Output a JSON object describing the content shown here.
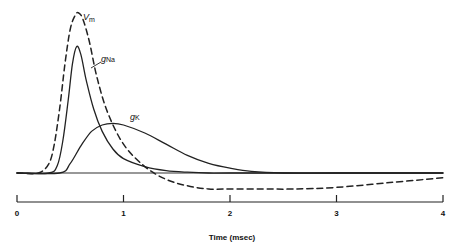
{
  "chart_data": {
    "type": "line",
    "title": "",
    "xlabel": "Time (msec)",
    "ylabel": "",
    "xlim": [
      0,
      4
    ],
    "xticks": [
      0,
      1,
      2,
      3,
      4
    ],
    "xtick_labels": [
      "0",
      "1",
      "2",
      "3",
      "4"
    ],
    "grid": false,
    "legend": "inline labels",
    "y_units": "relative (normalized, baseline = 0, peak Vm = 1)",
    "series": [
      {
        "name": "Vm",
        "label_main": "V",
        "label_sub": "m",
        "style": "dashed",
        "x": [
          0,
          0.2,
          0.3,
          0.35,
          0.4,
          0.45,
          0.5,
          0.55,
          0.58,
          0.62,
          0.68,
          0.75,
          0.85,
          1.0,
          1.2,
          1.4,
          1.6,
          1.8,
          2.0,
          2.3,
          2.6,
          3.0,
          3.5,
          4.0
        ],
        "y": [
          0,
          0.0,
          0.06,
          0.18,
          0.4,
          0.68,
          0.9,
          0.99,
          1.0,
          0.96,
          0.82,
          0.6,
          0.38,
          0.18,
          0.04,
          -0.04,
          -0.08,
          -0.1,
          -0.1,
          -0.1,
          -0.1,
          -0.09,
          -0.06,
          -0.03
        ]
      },
      {
        "name": "gNa",
        "label_main": "g",
        "label_sub": "Na",
        "style": "solid",
        "x": [
          0,
          0.3,
          0.38,
          0.43,
          0.48,
          0.52,
          0.56,
          0.6,
          0.65,
          0.72,
          0.8,
          0.9,
          1.0,
          1.2,
          1.4,
          1.6,
          1.8,
          2.0,
          3.0,
          4.0
        ],
        "y": [
          0,
          0.0,
          0.05,
          0.2,
          0.45,
          0.68,
          0.79,
          0.74,
          0.58,
          0.4,
          0.26,
          0.15,
          0.09,
          0.04,
          0.015,
          0.005,
          0.0,
          0.0,
          0.0,
          0.0
        ]
      },
      {
        "name": "gK",
        "label_main": "g",
        "label_sub": "K",
        "style": "solid",
        "x": [
          0,
          0.4,
          0.5,
          0.6,
          0.7,
          0.8,
          0.9,
          1.0,
          1.2,
          1.4,
          1.6,
          1.8,
          2.0,
          2.2,
          2.5,
          3.0,
          4.0
        ],
        "y": [
          0,
          0.0,
          0.06,
          0.17,
          0.26,
          0.3,
          0.31,
          0.3,
          0.25,
          0.18,
          0.11,
          0.06,
          0.03,
          0.01,
          0.0,
          0.0,
          0.0
        ]
      }
    ],
    "annotations": [
      {
        "text": "Vm",
        "near": "Vm peak, right side"
      },
      {
        "text": "gNa",
        "near": "gNa falling phase, with leader line"
      },
      {
        "text": "gK",
        "near": "gK peak, above"
      }
    ]
  },
  "colors": {
    "line": "#222222",
    "background": "#ffffff"
  }
}
